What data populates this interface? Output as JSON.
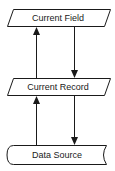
{
  "diagram": {
    "nodes": [
      {
        "id": "current-field",
        "label": "Current Field",
        "shape": "parallelogram"
      },
      {
        "id": "current-record",
        "label": "Current Record",
        "shape": "parallelogram"
      },
      {
        "id": "data-source",
        "label": "Data Source",
        "shape": "stored-data"
      }
    ],
    "edges": [
      {
        "from": "current-record",
        "to": "current-field",
        "direction": "up"
      },
      {
        "from": "current-field",
        "to": "current-record",
        "direction": "down"
      },
      {
        "from": "data-source",
        "to": "current-record",
        "direction": "up"
      },
      {
        "from": "current-record",
        "to": "data-source",
        "direction": "down"
      }
    ],
    "colors": {
      "stroke": "#1a1a1a",
      "fill": "#ffffff"
    }
  }
}
